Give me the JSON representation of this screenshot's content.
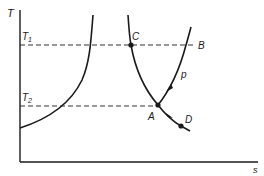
{
  "diagram": {
    "type": "temperature-entropy diagram",
    "axes": {
      "y_label": "T",
      "x_label": "s"
    },
    "isotherms": [
      {
        "label_main": "T",
        "label_sub": "1",
        "y": 45
      },
      {
        "label_main": "T",
        "label_sub": "2",
        "y": 106
      }
    ],
    "points": [
      {
        "label": "C"
      },
      {
        "label": "B"
      },
      {
        "label": "A"
      },
      {
        "label": "D"
      }
    ],
    "isobar_label": "p",
    "colors": {
      "line": "#1a1a1a",
      "dashed": "#333333",
      "background": "#ffffff"
    }
  }
}
